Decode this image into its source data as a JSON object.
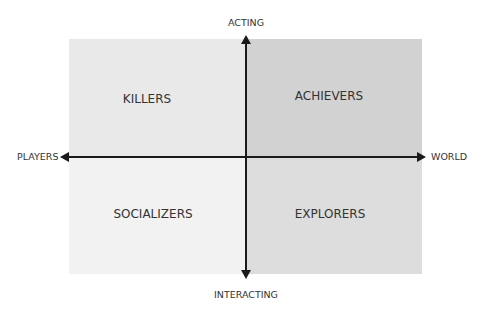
{
  "diagram": {
    "axes": {
      "top": "ACTING",
      "bottom": "INTERACTING",
      "left": "PLAYERS",
      "right": "WORLD"
    },
    "quadrants": {
      "top_left": {
        "label": "KILLERS",
        "color": "#e9e9e9"
      },
      "top_right": {
        "label": "ACHIEVERS",
        "color": "#d2d2d2"
      },
      "bottom_left": {
        "label": "SOCIALIZERS",
        "color": "#f2f2f2"
      },
      "bottom_right": {
        "label": "EXPLORERS",
        "color": "#dddddd"
      }
    },
    "axis_color": "#1a1a1a"
  }
}
